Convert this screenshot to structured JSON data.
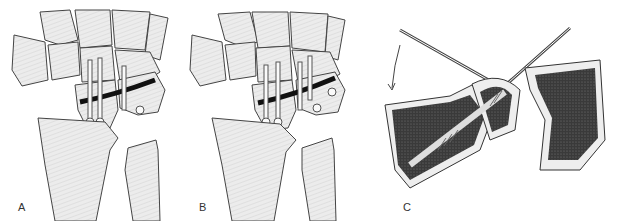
{
  "figure": {
    "panels": [
      {
        "id": "A",
        "label": "A",
        "description": "Wrist bones with scaphoid fracture fixed by three screws (two in distal pole, one in proximal pole)"
      },
      {
        "id": "B",
        "label": "B",
        "description": "Wrist bones with scaphoid fracture fixed by four screws (two in each fragment)"
      },
      {
        "id": "C",
        "label": "C",
        "description": "Cross-section of scaphoid with guide wires and cannulated screw insertion, curved arrow indicating direction"
      }
    ]
  }
}
